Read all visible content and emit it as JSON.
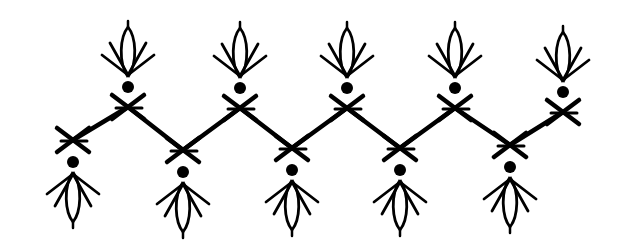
{
  "image": {
    "description": "Black ink line drawing of a decorative zigzag border with stylized flower/bud motifs",
    "width": 629,
    "height": 252,
    "background": "#ffffff",
    "ink": "#000000"
  },
  "zigzag": {
    "vertices": [
      {
        "x": 73,
        "y": 140,
        "pos": "bottom"
      },
      {
        "x": 128,
        "y": 107,
        "pos": "top"
      },
      {
        "x": 183,
        "y": 150,
        "pos": "bottom"
      },
      {
        "x": 240,
        "y": 108,
        "pos": "top"
      },
      {
        "x": 292,
        "y": 148,
        "pos": "bottom"
      },
      {
        "x": 347,
        "y": 108,
        "pos": "top"
      },
      {
        "x": 400,
        "y": 148,
        "pos": "bottom"
      },
      {
        "x": 455,
        "y": 108,
        "pos": "top"
      },
      {
        "x": 510,
        "y": 145,
        "pos": "bottom"
      },
      {
        "x": 563,
        "y": 112,
        "pos": "top"
      }
    ]
  },
  "motifs": {
    "top_count": 5,
    "bottom_count": 5,
    "elements": [
      "cross-mark",
      "dot",
      "bud-with-leaves"
    ]
  }
}
